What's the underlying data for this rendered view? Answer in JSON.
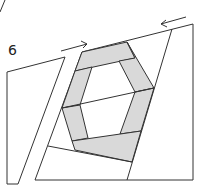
{
  "figure": {
    "label": "6",
    "colors": {
      "stroke": "#333333",
      "fill_shaded": "#d9d9d9",
      "background": "#ffffff"
    },
    "arrows": [
      {
        "name": "arrow-right",
        "direction": "right"
      },
      {
        "name": "arrow-left",
        "direction": "left"
      }
    ],
    "pieces": [
      "left-strip",
      "main-block",
      "hexagon-ring"
    ]
  }
}
